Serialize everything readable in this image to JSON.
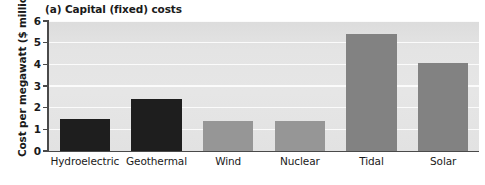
{
  "chart_data": {
    "type": "bar",
    "title": "(a) Capital (fixed) costs",
    "xlabel": "",
    "ylabel": "Cost per megawatt ($ million)",
    "categories": [
      "Hydroelectric",
      "Geothermal",
      "Wind",
      "Nuclear",
      "Tidal",
      "Solar"
    ],
    "values": [
      1.5,
      2.4,
      1.4,
      1.4,
      5.4,
      4.05
    ],
    "bar_colors": [
      "#1e1e1e",
      "#1e1e1e",
      "#969696",
      "#969696",
      "#828282",
      "#828282"
    ],
    "ylim": [
      0,
      6
    ],
    "yticks": [
      0,
      1,
      2,
      3,
      4,
      5,
      6
    ],
    "ytick_labels": [
      "0",
      "1",
      "2",
      "3",
      "4",
      "5",
      "6"
    ],
    "grid": true,
    "grid_color": "#fbfbfb",
    "plot_background": "#e4e4e4",
    "axis_color": "#4a4a4a",
    "legend": null
  }
}
